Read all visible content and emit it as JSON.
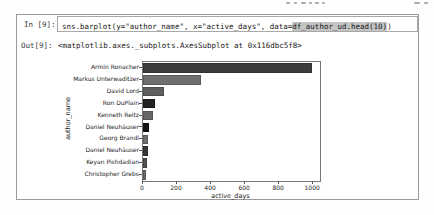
{
  "notebook": {
    "in_prompt": "In [9]:",
    "out_prompt": "Out[9]:",
    "code_pre": "sns.barplot(y=\"author_name\", x=\"active_days\", data=",
    "code_highlight": "df_author_ud.head(10)",
    "code_post": ")",
    "output_text": "<matplotlib.axes._subplots.AxesSubplot at 0x116dbc5f8>"
  },
  "chart_data": {
    "type": "bar",
    "orientation": "horizontal",
    "title": "",
    "categories": [
      "Armin Ronacher",
      "Markus Unterwaditzer",
      "David Lord",
      "Ron DuPlain",
      "Kenneth Reitz",
      "Daniel Neuhäuser",
      "Georg Brandl",
      "Daniel Neuhäuser",
      "Keyan Pishdadian",
      "Christopher Grebs"
    ],
    "values": [
      995,
      340,
      122,
      68,
      60,
      38,
      31,
      30,
      23,
      20
    ],
    "bar_colors": [
      "#3d3d3d",
      "#6f6f6f",
      "#5e5e5e",
      "#232323",
      "#676767",
      "#141414",
      "#6f6f6f",
      "#383838",
      "#525252",
      "#6a6a6a"
    ],
    "xlabel": "active_days",
    "ylabel": "author_name",
    "xticks": [
      0,
      200,
      400,
      600,
      800,
      1000
    ],
    "xlim": [
      0,
      1040
    ],
    "grid": false,
    "legend": "none"
  }
}
